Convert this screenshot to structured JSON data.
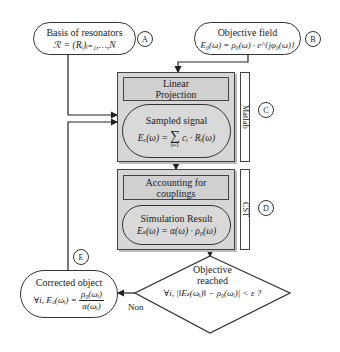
{
  "nodes": {
    "basis": {
      "title": "Basis of resonators",
      "formula": "ℛ = (Rᵢ)ᵢ₌₁,…,N",
      "marker": "A"
    },
    "objective": {
      "title": "Objective field",
      "formula": "E₀(ω) = ρ₀(ω) · e^{jφ₀(ω)}",
      "marker": "B"
    },
    "linear_projection": {
      "line1": "Linear",
      "line2": "Projection"
    },
    "sampled_signal": {
      "title": "Sampled signal",
      "formula_lhs": "Eₑ(ω) =",
      "formula_sum": "∑",
      "formula_sum_lower": "i=1",
      "formula_rhs": "cᵢ · Rᵢ(ω)"
    },
    "matlab_group": {
      "label": "Matlab",
      "marker": "C"
    },
    "accounting": {
      "line1": "Accounting for",
      "line2": "couplings"
    },
    "simulation": {
      "title": "Simulation Result",
      "formula": "Eₛ(ω) = α(ω) · ρ₀(ω)"
    },
    "cst_group": {
      "label": "CST",
      "marker": "D"
    },
    "decision": {
      "line1": "Objective",
      "line2": "reached",
      "condition": "∀i, |‖Eₛ(ωᵢ)‖ − ρ₀(ωᵢ)| < ε ?"
    },
    "corrected": {
      "title": "Corrected object",
      "formula_lhs": "∀i, E꜀(ωᵢ) =",
      "frac_num": "ρ₀(ωᵢ)",
      "frac_den": "α(ωᵢ)",
      "marker": "E"
    }
  },
  "edges": {
    "no_label": "Non"
  }
}
